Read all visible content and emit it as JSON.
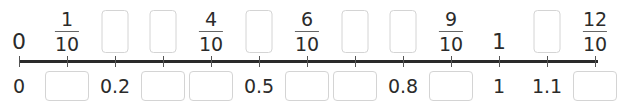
{
  "number_line": {
    "start_x": 19,
    "tick_spacing": 48,
    "tick_count": 13,
    "line_color": "#2a2a2a",
    "box_border_color": "#d4d4d4"
  },
  "top_labels": [
    {
      "type": "plain",
      "text": "0"
    },
    {
      "type": "fraction",
      "numerator": "1",
      "denominator": "10"
    },
    {
      "type": "blank"
    },
    {
      "type": "blank"
    },
    {
      "type": "fraction",
      "numerator": "4",
      "denominator": "10"
    },
    {
      "type": "blank"
    },
    {
      "type": "fraction",
      "numerator": "6",
      "denominator": "10"
    },
    {
      "type": "blank"
    },
    {
      "type": "blank"
    },
    {
      "type": "fraction",
      "numerator": "9",
      "denominator": "10"
    },
    {
      "type": "plain",
      "text": "1"
    },
    {
      "type": "blank"
    },
    {
      "type": "fraction",
      "numerator": "12",
      "denominator": "10"
    }
  ],
  "bottom_labels": [
    {
      "type": "plain",
      "text": "0"
    },
    {
      "type": "blank"
    },
    {
      "type": "plain",
      "text": "0.2"
    },
    {
      "type": "blank"
    },
    {
      "type": "blank"
    },
    {
      "type": "plain",
      "text": "0.5"
    },
    {
      "type": "blank"
    },
    {
      "type": "blank"
    },
    {
      "type": "plain",
      "text": "0.8"
    },
    {
      "type": "blank"
    },
    {
      "type": "plain",
      "text": "1"
    },
    {
      "type": "plain",
      "text": "1.1"
    },
    {
      "type": "blank"
    }
  ]
}
